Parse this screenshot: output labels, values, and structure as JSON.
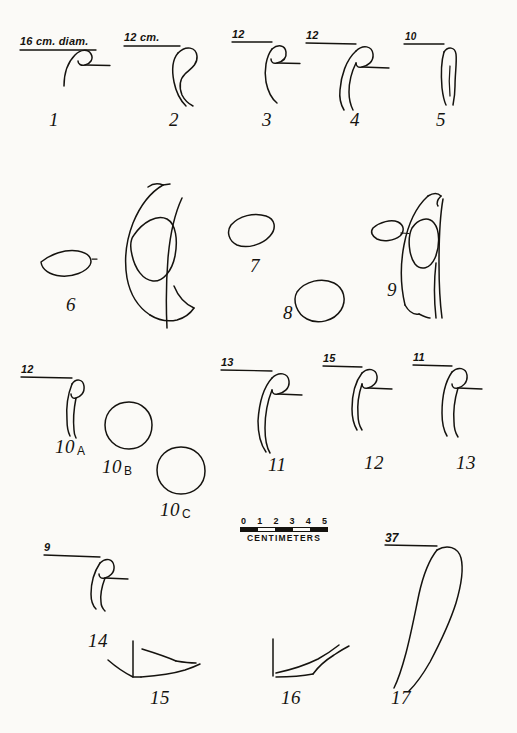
{
  "plate": {
    "title": "Pottery rim, body and base profile drawings",
    "background_color": "#fbfaf7",
    "ink_color": "#15130f",
    "width": 517,
    "height": 733
  },
  "scale_bar": {
    "name": "scale-bar",
    "ticks": [
      "0",
      "1",
      "2",
      "3",
      "4",
      "5"
    ],
    "caption": "CENTIMETERS",
    "segments": [
      "dark",
      "light",
      "dark",
      "light",
      "dark"
    ]
  },
  "figures": [
    {
      "id": "fig-1",
      "number": "1",
      "sub": "",
      "dimension": "16 cm. diam.",
      "type": "rim-profile"
    },
    {
      "id": "fig-2",
      "number": "2",
      "sub": "",
      "dimension": "12 cm.",
      "type": "rim-profile"
    },
    {
      "id": "fig-3",
      "number": "3",
      "sub": "",
      "dimension": "12",
      "type": "rim-profile"
    },
    {
      "id": "fig-4",
      "number": "4",
      "sub": "",
      "dimension": "12",
      "type": "rim-profile"
    },
    {
      "id": "fig-5",
      "number": "5",
      "sub": "",
      "dimension": "10",
      "type": "rim-profile"
    },
    {
      "id": "fig-6",
      "number": "6",
      "sub": "",
      "dimension": "",
      "type": "handle-section"
    },
    {
      "id": "fig-7",
      "number": "7",
      "sub": "",
      "dimension": "",
      "type": "handle-cross-section"
    },
    {
      "id": "fig-8",
      "number": "8",
      "sub": "",
      "dimension": "",
      "type": "handle-cross-section"
    },
    {
      "id": "fig-9",
      "number": "9",
      "sub": "",
      "dimension": "",
      "type": "handle-section"
    },
    {
      "id": "fig-10a",
      "number": "10",
      "sub": "A",
      "dimension": "12",
      "type": "rim-profile"
    },
    {
      "id": "fig-10b",
      "number": "10",
      "sub": "B",
      "dimension": "",
      "type": "handle-cross-section"
    },
    {
      "id": "fig-10c",
      "number": "10",
      "sub": "C",
      "dimension": "",
      "type": "handle-cross-section"
    },
    {
      "id": "fig-11",
      "number": "11",
      "sub": "",
      "dimension": "13",
      "type": "rim-profile"
    },
    {
      "id": "fig-12",
      "number": "12",
      "sub": "",
      "dimension": "15",
      "type": "rim-profile"
    },
    {
      "id": "fig-13",
      "number": "13",
      "sub": "",
      "dimension": "11",
      "type": "rim-profile"
    },
    {
      "id": "fig-14",
      "number": "14",
      "sub": "",
      "dimension": "9",
      "type": "rim-profile"
    },
    {
      "id": "fig-15",
      "number": "15",
      "sub": "",
      "dimension": "",
      "type": "base-profile"
    },
    {
      "id": "fig-16",
      "number": "16",
      "sub": "",
      "dimension": "6",
      "type": "base-profile"
    },
    {
      "id": "fig-17",
      "number": "17",
      "sub": "",
      "dimension": "37",
      "type": "rim-profile"
    }
  ]
}
